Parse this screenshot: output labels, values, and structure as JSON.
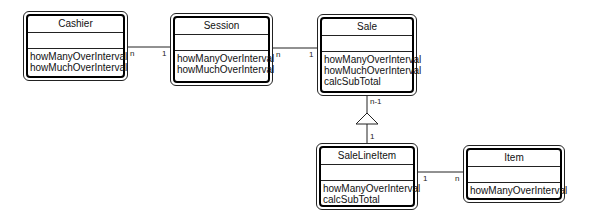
{
  "diagram": {
    "type": "UML class diagram",
    "classes": [
      {
        "id": "cashier",
        "name": "Cashier",
        "attributes": [],
        "operations": [
          "howManyOverInterval",
          "howMuchOverInterval"
        ]
      },
      {
        "id": "session",
        "name": "Session",
        "attributes": [],
        "operations": [
          "howManyOverInterval",
          "howMuchOverInterval"
        ]
      },
      {
        "id": "sale",
        "name": "Sale",
        "attributes": [],
        "operations": [
          "howManyOverInterval",
          "howMuchOverInterval",
          "calcSubTotal"
        ]
      },
      {
        "id": "salelineitem",
        "name": "SaleLineItem",
        "attributes": [],
        "operations": [
          "howManyOverInterval",
          "calcSubTotal"
        ]
      },
      {
        "id": "item",
        "name": "Item",
        "attributes": [],
        "operations": [
          "howManyOverInterval"
        ]
      }
    ],
    "associations": [
      {
        "from": "Cashier",
        "to": "Session",
        "from_mult": "n",
        "to_mult": "1"
      },
      {
        "from": "Session",
        "to": "Sale",
        "from_mult": "n",
        "to_mult": "1"
      },
      {
        "from": "Sale",
        "to": "SaleLineItem",
        "from_mult": "n-1",
        "to_mult": "1",
        "kind": "aggregation-triangle"
      },
      {
        "from": "SaleLineItem",
        "to": "Item",
        "from_mult": "1",
        "to_mult": "n"
      }
    ]
  }
}
